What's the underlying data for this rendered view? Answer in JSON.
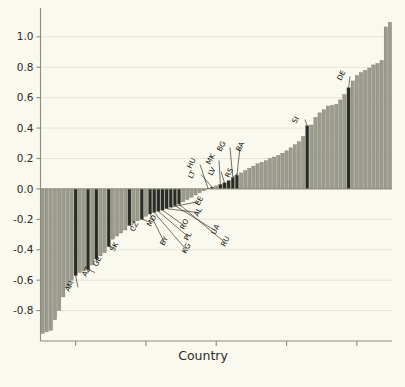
{
  "chart_data": {
    "type": "bar",
    "title": "",
    "subtitle": "",
    "xlabel": "Country",
    "ylabel": "",
    "ylim": [
      -1.0,
      1.15
    ],
    "xlim": [
      0,
      86
    ],
    "grid": true,
    "legend": null,
    "ytick_labels": [
      "1.0",
      "0.8",
      "0.6",
      "0.4",
      "0.2",
      "0.0",
      "-0.2",
      "-0.4",
      "-0.6",
      "-0.8"
    ],
    "ytick_values": [
      1.0,
      0.8,
      0.6,
      0.4,
      0.2,
      0.0,
      -0.2,
      -0.4,
      -0.6,
      -0.8
    ],
    "xtick_labels": [
      "",
      "",
      "",
      "",
      ""
    ],
    "xtick_count": 5,
    "bar_colors": {
      "default": "#9b9b8e",
      "highlight": "#2b2b26"
    },
    "sorted": true,
    "categories": [
      "b1",
      "b2",
      "b3",
      "b4",
      "b5",
      "b6",
      "b7",
      "b8",
      "AM",
      "b10",
      "b11",
      "AZ",
      "b13",
      "GE",
      "b15",
      "b16",
      "SK",
      "b18",
      "b19",
      "b20",
      "b21",
      "CZ",
      "b23",
      "b24",
      "MD",
      "b26",
      "BY",
      "KG",
      "PL",
      "RO",
      "AL",
      "EE",
      "UA",
      "RU",
      "b35",
      "b36",
      "b37",
      "b38",
      "b39",
      "b40",
      "HU",
      "LT",
      "b43",
      "MK",
      "LV",
      "RS",
      "BG",
      "BA",
      "b49",
      "b50",
      "b51",
      "b52",
      "b53",
      "b54",
      "b55",
      "b56",
      "b57",
      "b58",
      "b59",
      "b60",
      "b61",
      "b62",
      "b63",
      "b64",
      "SI",
      "b66",
      "b67",
      "b68",
      "b69",
      "b70",
      "b71",
      "b72",
      "b73",
      "b74",
      "DE",
      "b76",
      "b77",
      "b78",
      "b79",
      "b80",
      "b81",
      "b82",
      "b83",
      "b84",
      "b85"
    ],
    "values": [
      -0.95,
      -0.94,
      -0.93,
      -0.86,
      -0.8,
      -0.71,
      -0.65,
      -0.6,
      -0.57,
      -0.55,
      -0.54,
      -0.53,
      -0.5,
      -0.46,
      -0.44,
      -0.42,
      -0.38,
      -0.33,
      -0.31,
      -0.29,
      -0.27,
      -0.24,
      -0.22,
      -0.21,
      -0.2,
      -0.18,
      -0.165,
      -0.155,
      -0.148,
      -0.14,
      -0.13,
      -0.12,
      -0.11,
      -0.1,
      -0.085,
      -0.07,
      -0.055,
      -0.04,
      -0.025,
      -0.012,
      0.005,
      0.012,
      0.02,
      0.03,
      0.04,
      0.055,
      0.075,
      0.09,
      0.105,
      0.12,
      0.135,
      0.15,
      0.165,
      0.175,
      0.185,
      0.2,
      0.21,
      0.22,
      0.235,
      0.25,
      0.27,
      0.29,
      0.31,
      0.345,
      0.415,
      0.42,
      0.47,
      0.5,
      0.52,
      0.545,
      0.55,
      0.555,
      0.585,
      0.62,
      0.665,
      0.71,
      0.745,
      0.765,
      0.78,
      0.795,
      0.815,
      0.825,
      0.845,
      1.065,
      1.095
    ],
    "highlight_indices": [
      8,
      11,
      13,
      16,
      21,
      24,
      26,
      27,
      28,
      29,
      30,
      31,
      32,
      33,
      40,
      41,
      43,
      44,
      45,
      46,
      47,
      64,
      74
    ],
    "annotations": [
      {
        "code": "AM",
        "bar_index": 8,
        "label_x": 69,
        "label_y": 292,
        "anchor_x": 61,
        "anchor_y": 276
      },
      {
        "code": "AZ",
        "bar_index": 11,
        "label_x": 86,
        "label_y": 277,
        "anchor_x": 79,
        "anchor_y": 262
      },
      {
        "code": "GE",
        "bar_index": 13,
        "label_x": 97,
        "label_y": 267,
        "anchor_x": 90,
        "anchor_y": 250
      },
      {
        "code": "SK",
        "bar_index": 16,
        "label_x": 114,
        "label_y": 252,
        "anchor_x": 108,
        "anchor_y": 238
      },
      {
        "code": "CZ",
        "bar_index": 21,
        "label_x": 134,
        "label_y": 232,
        "anchor_x": 131,
        "anchor_y": 222
      },
      {
        "code": "MD",
        "bar_index": 24,
        "label_x": 151,
        "label_y": 227,
        "anchor_x": 146,
        "anchor_y": 217
      },
      {
        "code": "BY",
        "bar_index": 26,
        "label_x": 164,
        "label_y": 246,
        "anchor_x": 155,
        "anchor_y": 214
      },
      {
        "code": "KG",
        "bar_index": 27,
        "label_x": 186,
        "label_y": 254,
        "anchor_x": 159,
        "anchor_y": 212
      },
      {
        "code": "PL",
        "bar_index": 28,
        "label_x": 188,
        "label_y": 241,
        "anchor_x": 163,
        "anchor_y": 211
      },
      {
        "code": "RO",
        "bar_index": 29,
        "label_x": 184,
        "label_y": 230,
        "anchor_x": 167,
        "anchor_y": 210
      },
      {
        "code": "AL",
        "bar_index": 30,
        "label_x": 198,
        "label_y": 217,
        "anchor_x": 172,
        "anchor_y": 209
      },
      {
        "code": "EE",
        "bar_index": 31,
        "label_x": 199,
        "label_y": 206,
        "anchor_x": 177,
        "anchor_y": 207
      },
      {
        "code": "UA",
        "bar_index": 32,
        "label_x": 215,
        "label_y": 235,
        "anchor_x": 181,
        "anchor_y": 206
      },
      {
        "code": "RU",
        "bar_index": 33,
        "label_x": 225,
        "label_y": 247,
        "anchor_x": 186,
        "anchor_y": 205
      },
      {
        "code": "HU",
        "bar_index": 40,
        "label_x": 191,
        "label_y": 169,
        "anchor_x": 205,
        "anchor_y": 191
      },
      {
        "code": "LT",
        "bar_index": 41,
        "label_x": 192,
        "label_y": 179,
        "anchor_x": 208,
        "anchor_y": 191
      },
      {
        "code": "MK",
        "bar_index": 43,
        "label_x": 210,
        "label_y": 165,
        "anchor_x": 214,
        "anchor_y": 189
      },
      {
        "code": "LV",
        "bar_index": 44,
        "label_x": 212,
        "label_y": 176,
        "anchor_x": 217,
        "anchor_y": 188
      },
      {
        "code": "RS",
        "bar_index": 46,
        "label_x": 229,
        "label_y": 178,
        "anchor_x": 227,
        "anchor_y": 185
      },
      {
        "code": "BG",
        "bar_index": 46,
        "label_x": 221,
        "label_y": 152,
        "anchor_x": 231,
        "anchor_y": 183
      },
      {
        "code": "BA",
        "bar_index": 47,
        "label_x": 240,
        "label_y": 152,
        "anchor_x": 244,
        "anchor_y": 181
      },
      {
        "code": "SI",
        "bar_index": 64,
        "label_x": 296,
        "label_y": 124,
        "anchor_x": 300,
        "anchor_y": 131
      },
      {
        "code": "DE",
        "bar_index": 74,
        "label_x": 341,
        "label_y": 81,
        "anchor_x": 345,
        "anchor_y": 89
      }
    ]
  },
  "axis": {
    "x_title": "Country"
  }
}
